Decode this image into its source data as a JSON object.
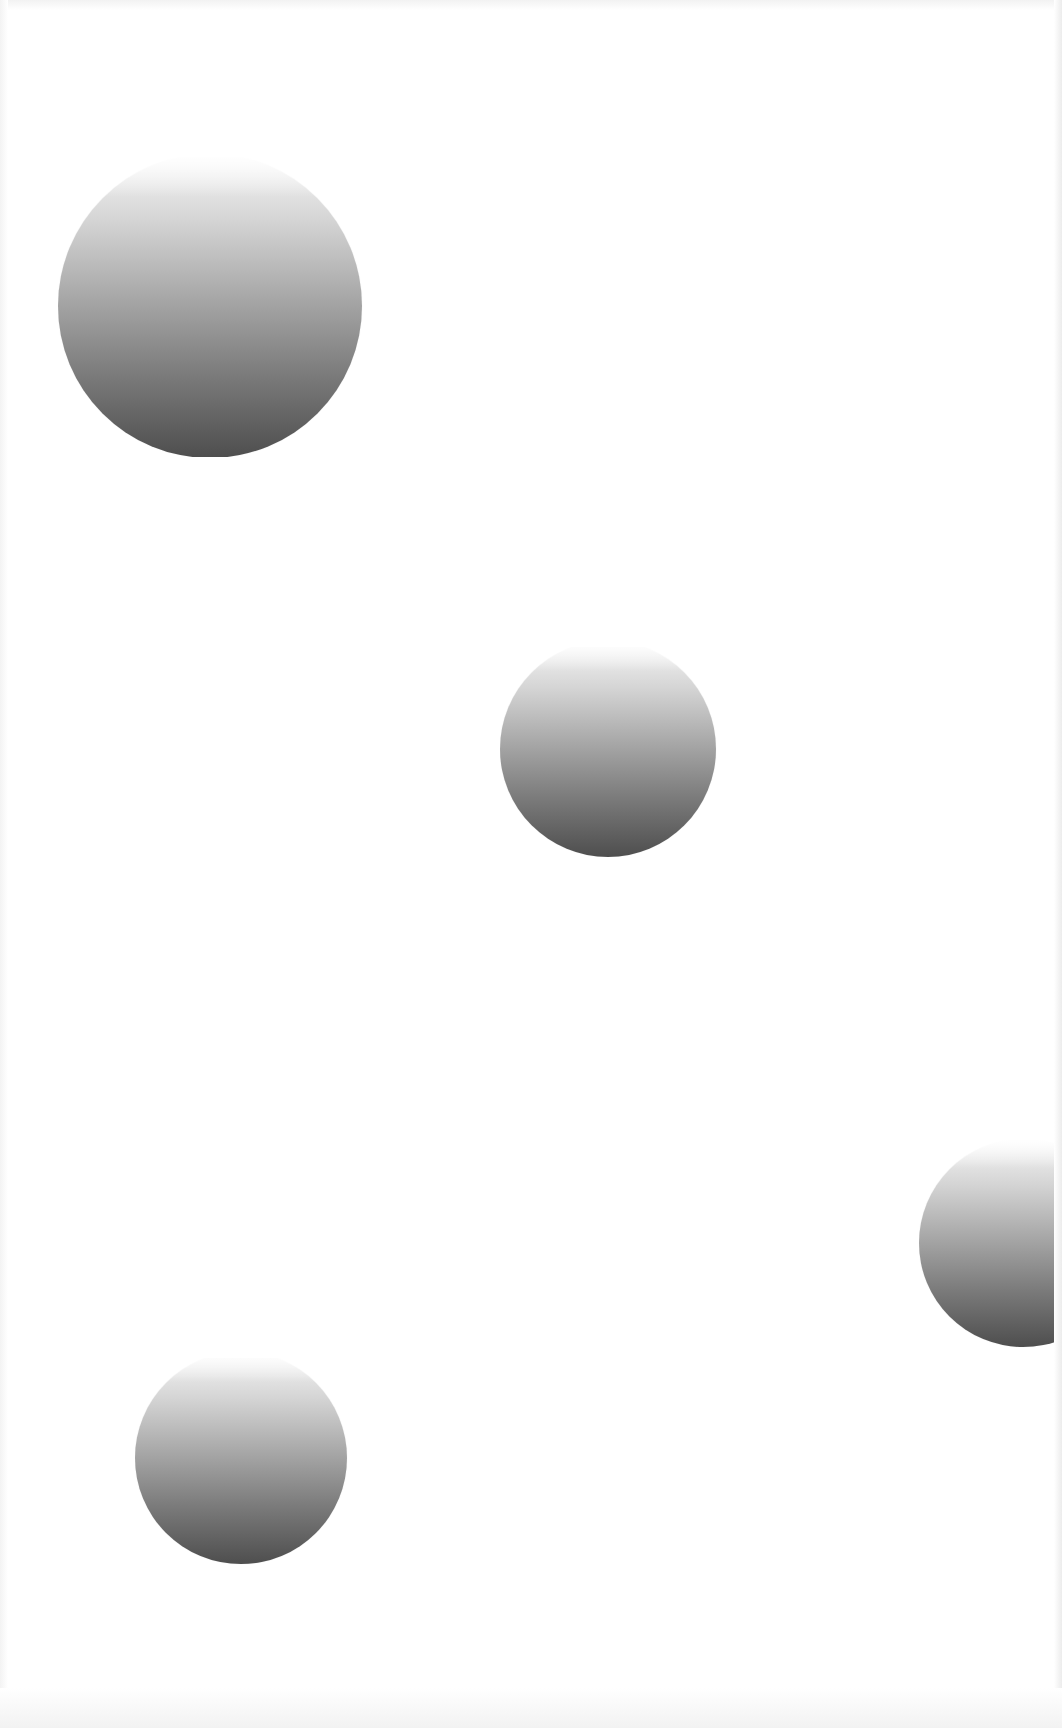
{
  "page": {
    "width": 1062,
    "height": 1728,
    "background": "#ffffff"
  },
  "spheres": [
    {
      "name": "sphere-large-top-left",
      "cx": 210,
      "cy": 306,
      "r": 152,
      "clip_top": 157
    },
    {
      "name": "sphere-center",
      "cx": 608,
      "cy": 750,
      "r": 108,
      "clip_top": 647
    },
    {
      "name": "sphere-right-edge",
      "cx": 1023,
      "cy": 1243,
      "r": 104,
      "clip_top": 1140,
      "clip_right": 1056
    },
    {
      "name": "sphere-bottom-left",
      "cx": 241,
      "cy": 1460,
      "r": 106,
      "clip_top": 1358
    }
  ],
  "colors": {
    "sphere_top": "#f6f6f6",
    "sphere_bottom": "#4e4e4e"
  }
}
